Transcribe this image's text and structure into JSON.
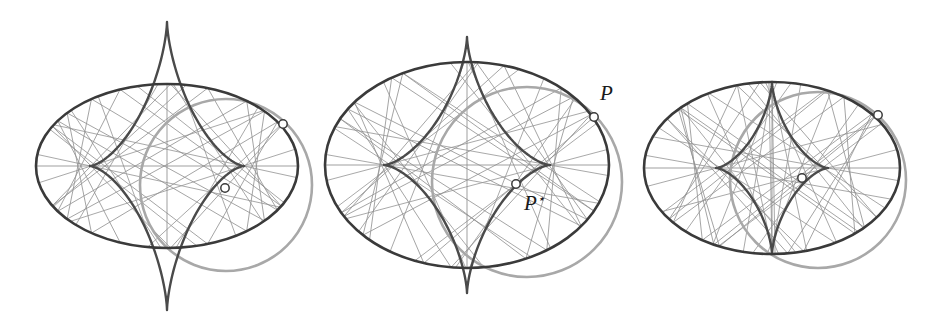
{
  "figure": {
    "title": "",
    "background_color": "#ffffff",
    "width": 932,
    "height": 331,
    "type": "geometric-diagram"
  },
  "style": {
    "ellipse_color": "#3a3a3a",
    "ellipse_width": 2.6,
    "circle_color": "#a8a8a8",
    "circle_width": 2.6,
    "chord_color": "#8f8f8f",
    "chord_width": 0.85,
    "caustic_color": "#4a4a4a",
    "caustic_width": 2.4,
    "marker_fill": "#ffffff",
    "marker_stroke": "#3a3a3a",
    "marker_radius": 4.2,
    "label_color": "#1a1a1a"
  },
  "labels": {
    "point_p": "P",
    "point_p_star_base": "P",
    "point_p_star_mark": "⋆"
  },
  "panels": [
    {
      "name": "panel-left",
      "index": 1,
      "ellipse": {
        "cx": 167,
        "cy": 166,
        "rx": 131,
        "ry": 82
      },
      "circle": {
        "cx": 226,
        "cy": 185,
        "r": 86
      },
      "caustic": {
        "cx": 167,
        "cy": 166,
        "ax": 77,
        "ay": 144,
        "cusp_top": {
          "x": 167,
          "y": 22
        },
        "cusp_bottom": {
          "x": 167,
          "y": 310
        },
        "cusp_left": {
          "x": 90,
          "y": 166
        },
        "cusp_right": {
          "x": 244,
          "y": 166
        }
      },
      "point_p": {
        "x": 283,
        "y": 124,
        "label_x": 0,
        "label_y": 0,
        "show_label": false
      },
      "point_p_star": {
        "x": 225,
        "y": 188,
        "label_x": 0,
        "label_y": 0,
        "show_label": false
      },
      "chord_count": 21,
      "chord_source_angle_deg": 36
    },
    {
      "name": "panel-middle",
      "index": 2,
      "ellipse": {
        "cx": 467,
        "cy": 165,
        "rx": 142,
        "ry": 103
      },
      "circle": {
        "cx": 527,
        "cy": 182,
        "r": 95
      },
      "caustic": {
        "cx": 467,
        "cy": 165,
        "ax": 83,
        "ay": 128,
        "cusp_top": {
          "x": 467,
          "y": 37
        },
        "cusp_bottom": {
          "x": 467,
          "y": 293
        },
        "cusp_left": {
          "x": 384,
          "y": 165
        },
        "cusp_right": {
          "x": 550,
          "y": 165
        }
      },
      "point_p": {
        "x": 594,
        "y": 117,
        "label_x": 600,
        "label_y": 100,
        "show_label": true
      },
      "point_p_star": {
        "x": 516,
        "y": 184,
        "label_x": 524,
        "label_y": 210,
        "show_label": true
      },
      "chord_count": 21,
      "chord_source_angle_deg": 36
    },
    {
      "name": "panel-right",
      "index": 3,
      "ellipse": {
        "cx": 772,
        "cy": 168,
        "rx": 128,
        "ry": 86
      },
      "circle": {
        "cx": 818,
        "cy": 180,
        "r": 88
      },
      "caustic": {
        "cx": 772,
        "cy": 168,
        "ax": 56,
        "ay": 86,
        "cusp_top": {
          "x": 772,
          "y": 82
        },
        "cusp_bottom": {
          "x": 772,
          "y": 254
        },
        "cusp_left": {
          "x": 716,
          "y": 168
        },
        "cusp_right": {
          "x": 828,
          "y": 168
        }
      },
      "point_p": {
        "x": 878,
        "y": 115,
        "label_x": 0,
        "label_y": 0,
        "show_label": false
      },
      "point_p_star": {
        "x": 802,
        "y": 178,
        "label_x": 0,
        "label_y": 0,
        "show_label": false
      },
      "chord_count": 21,
      "chord_source_angle_deg": 36
    }
  ]
}
